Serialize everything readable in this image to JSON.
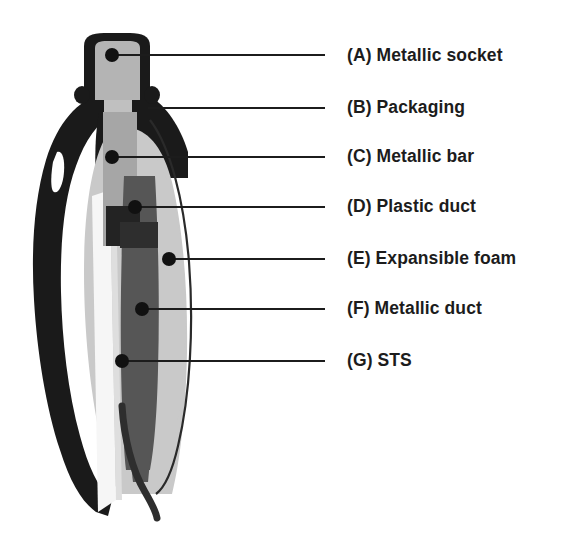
{
  "figure": {
    "type": "cross-section-diagram",
    "background_color": "#ffffff"
  },
  "colors": {
    "packaging_black": "#1a1a1a",
    "foam_light_gray": "#c9c9c9",
    "duct_dark_gray": "#565656",
    "bar_mid_gray": "#a6a6a6",
    "socket_gray": "#b4b4b4",
    "plastic_white": "#f4f4f4",
    "leader_line": "#1c1c1c",
    "text": "#1c1c1c"
  },
  "legend": {
    "items": [
      {
        "key": "A",
        "label": "(A) Metallic socket",
        "text_y": 56,
        "leader": {
          "x1": 112,
          "y1": 55,
          "x2": 325,
          "y2": 55,
          "dot": true,
          "dot_x": 112,
          "dot_y": 55
        }
      },
      {
        "key": "B",
        "label": "(B) Packaging",
        "text_y": 108,
        "leader": {
          "x1": 148,
          "y1": 108,
          "x2": 325,
          "y2": 108,
          "dot": false,
          "dot_x": 0,
          "dot_y": 0
        }
      },
      {
        "key": "C",
        "label": "(C) Metallic bar",
        "text_y": 157,
        "leader": {
          "x1": 112,
          "y1": 157,
          "x2": 325,
          "y2": 157,
          "dot": true,
          "dot_x": 112,
          "dot_y": 157
        }
      },
      {
        "key": "D",
        "label": "(D) Plastic duct",
        "text_y": 207,
        "leader": {
          "x1": 135,
          "y1": 207,
          "x2": 325,
          "y2": 207,
          "dot": true,
          "dot_x": 135,
          "dot_y": 207
        }
      },
      {
        "key": "E",
        "label": "(E) Expansible foam",
        "text_y": 259,
        "leader": {
          "x1": 169,
          "y1": 259,
          "x2": 325,
          "y2": 259,
          "dot": true,
          "dot_x": 169,
          "dot_y": 259
        }
      },
      {
        "key": "F",
        "label": "(F) Metallic duct",
        "text_y": 309,
        "leader": {
          "x1": 142,
          "y1": 309,
          "x2": 325,
          "y2": 309,
          "dot": true,
          "dot_x": 142,
          "dot_y": 309
        }
      },
      {
        "key": "G",
        "label": "(G) STS",
        "text_y": 361,
        "leader": {
          "x1": 122,
          "y1": 361,
          "x2": 325,
          "y2": 361,
          "dot": true,
          "dot_x": 122,
          "dot_y": 361
        }
      }
    ]
  }
}
